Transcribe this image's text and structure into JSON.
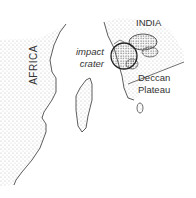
{
  "map": {
    "labels": {
      "africa": "AFRICA",
      "india": "INDIA",
      "crater_line1": "impact",
      "crater_line2": "crater",
      "deccan_line1": "Deccan",
      "deccan_line2": "Plateau"
    },
    "colors": {
      "land_stipple": "#8a8a8a",
      "outline": "#333333",
      "background": "#ffffff"
    }
  }
}
